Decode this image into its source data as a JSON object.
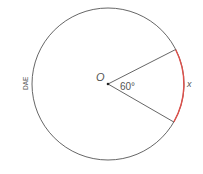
{
  "diagram": {
    "center_label": "O",
    "angle_label": "60°",
    "arc_label": "x",
    "side_label": "DAE",
    "colors": {
      "circle": "#555555",
      "arc_highlight": "#e0504a",
      "text": "#555555"
    }
  }
}
